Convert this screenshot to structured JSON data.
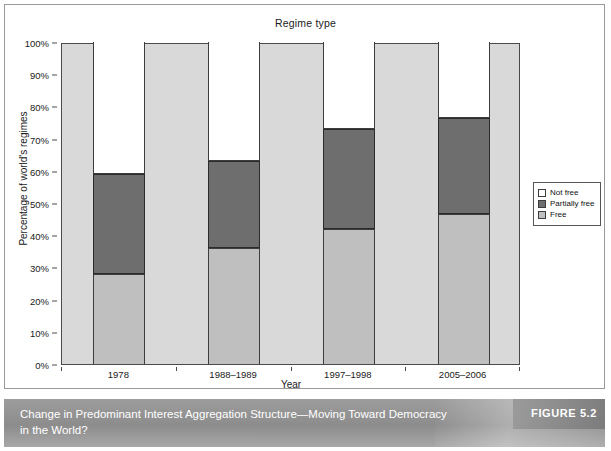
{
  "figure": {
    "caption": "Change in Predominant Interest Aggregation Structure—Moving Toward Democracy in the World?",
    "number_label": "FIGURE 5.2"
  },
  "legend": {
    "position": "right",
    "items": [
      {
        "label": "Not free",
        "color": "#ffffff",
        "swatch_name": "legend-swatch-not-free"
      },
      {
        "label": "Partially free",
        "color": "#6e6e6e",
        "swatch_name": "legend-swatch-partially-free"
      },
      {
        "label": "Free",
        "color": "#bfbfbf",
        "swatch_name": "legend-swatch-free"
      }
    ]
  },
  "chart_data": {
    "type": "bar",
    "stacked": true,
    "title": "Regime type",
    "xlabel": "Year",
    "ylabel": "Percentage of world's regimes",
    "categories": [
      "1978",
      "1988–1989",
      "1997–1998",
      "2005–2006"
    ],
    "ylim": [
      0,
      100
    ],
    "ytick_labels": [
      "0%",
      "10%",
      "20%",
      "30%",
      "40%",
      "50%",
      "60%",
      "70%",
      "80%",
      "90%",
      "100%"
    ],
    "ytick_values": [
      0,
      10,
      20,
      30,
      40,
      50,
      60,
      70,
      80,
      90,
      100
    ],
    "grid": false,
    "series": [
      {
        "name": "Free",
        "color": "#bfbfbf",
        "values": [
          28,
          36,
          42,
          46.5
        ]
      },
      {
        "name": "Partially free",
        "color": "#6e6e6e",
        "values": [
          31,
          27,
          31,
          30
        ]
      },
      {
        "name": "Not free",
        "color": "#ffffff",
        "values": [
          41,
          37,
          27,
          23.5
        ]
      }
    ],
    "cumulative_tops": {
      "Free": [
        28,
        36,
        42,
        46.5
      ],
      "Free+Partially free": [
        59,
        63,
        73,
        76.5
      ],
      "Total": [
        100,
        100,
        100,
        100
      ]
    }
  }
}
